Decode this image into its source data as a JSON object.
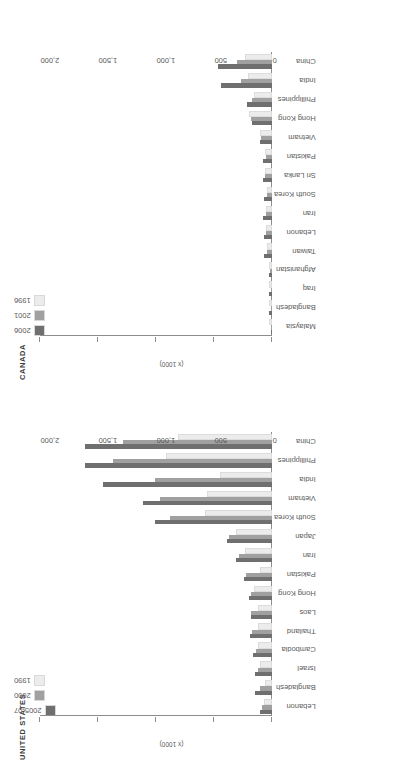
{
  "colors": {
    "series_dark": "#6f6f6f",
    "series_mid": "#a0a0a0",
    "series_light": "#ececec",
    "axis": "#8d8d8d",
    "text": "#545454"
  },
  "axis": {
    "unit_label": "(x 1000)",
    "ticks": [
      "0",
      "500",
      "1,000",
      "1,500",
      "2,000"
    ],
    "min": 0,
    "max": 2000
  },
  "charts": [
    {
      "title": "CANADA",
      "legend": [
        {
          "label": "2006",
          "color": "#6f6f6f"
        },
        {
          "label": "2001",
          "color": "#a0a0a0"
        },
        {
          "label": "1996",
          "color": "#ececec"
        }
      ],
      "categories": [
        "Malaysia",
        "Bangladesh",
        "Iraq",
        "Afghanistan",
        "Taiwan",
        "Lebanon",
        "Iran",
        "South Korea",
        "Sri Lanka",
        "Pakistan",
        "Vietnam",
        "Hong Kong",
        "Phillippines",
        "India",
        "China"
      ],
      "series": [
        {
          "name": "2006",
          "values": [
            8,
            22,
            23,
            28,
            65,
            65,
            75,
            65,
            80,
            75,
            105,
            175,
            215,
            440,
            465
          ]
        },
        {
          "name": "2001",
          "values": [
            6,
            10,
            12,
            14,
            45,
            48,
            50,
            45,
            60,
            55,
            95,
            180,
            175,
            270,
            300
          ]
        },
        {
          "name": "1996",
          "values": [
            4,
            6,
            8,
            9,
            30,
            35,
            35,
            30,
            45,
            40,
            85,
            180,
            135,
            190,
            215
          ]
        }
      ]
    },
    {
      "title": "UNITED STATES",
      "legend": [
        {
          "label": "2005-07",
          "color": "#6f6f6f"
        },
        {
          "label": "2000",
          "color": "#a0a0a0"
        },
        {
          "label": "1990",
          "color": "#ececec"
        }
      ],
      "categories": [
        "Lebanon",
        "Bangladesh",
        "Israel",
        "Cambodia",
        "Thailand",
        "Laos",
        "Hong Kong",
        "Pakistan",
        "Iran",
        "Japan",
        "South Korea",
        "Vietnam",
        "India",
        "Phillippines",
        "China"
      ],
      "series": [
        {
          "name": "2005-07",
          "values": [
            105,
            150,
            145,
            165,
            190,
            185,
            200,
            245,
            310,
            390,
            1010,
            1110,
            1460,
            1610,
            1610
          ]
        },
        {
          "name": "2000",
          "values": [
            90,
            105,
            125,
            140,
            170,
            180,
            180,
            225,
            285,
            375,
            880,
            965,
            1010,
            1370,
            1285
          ]
        },
        {
          "name": "1990",
          "values": [
            55,
            45,
            90,
            105,
            105,
            105,
            140,
            90,
            215,
            290,
            560,
            545,
            430,
            900,
            790
          ]
        }
      ]
    }
  ],
  "chart_data": {
    "type": "bar",
    "xlabel": "",
    "ylabel": "(x 1000)",
    "ylim": [
      0,
      2000
    ],
    "grid": false,
    "orientation": "vertical-bars-in-rotated-page",
    "legend_position": "top-left",
    "panels": [
      {
        "panel_title": "CANADA",
        "categories": [
          "Malaysia",
          "Bangladesh",
          "Iraq",
          "Afghanistan",
          "Taiwan",
          "Lebanon",
          "Iran",
          "South Korea",
          "Sri Lanka",
          "Pakistan",
          "Vietnam",
          "Hong Kong",
          "Phillippines",
          "India",
          "China"
        ],
        "series": [
          {
            "name": "2006",
            "values": [
              8,
              22,
              23,
              28,
              65,
              65,
              75,
              65,
              80,
              75,
              105,
              175,
              215,
              440,
              465
            ]
          },
          {
            "name": "2001",
            "values": [
              6,
              10,
              12,
              14,
              45,
              48,
              50,
              45,
              60,
              55,
              95,
              180,
              175,
              270,
              300
            ]
          },
          {
            "name": "1996",
            "values": [
              4,
              6,
              8,
              9,
              30,
              35,
              35,
              30,
              45,
              40,
              85,
              180,
              135,
              190,
              215
            ]
          }
        ]
      },
      {
        "panel_title": "UNITED STATES",
        "categories": [
          "Lebanon",
          "Bangladesh",
          "Israel",
          "Cambodia",
          "Thailand",
          "Laos",
          "Hong Kong",
          "Pakistan",
          "Iran",
          "Japan",
          "South Korea",
          "Vietnam",
          "India",
          "Phillippines",
          "China"
        ],
        "series": [
          {
            "name": "2005-07",
            "values": [
              105,
              150,
              145,
              165,
              190,
              185,
              200,
              245,
              310,
              390,
              1010,
              1110,
              1460,
              1610,
              1610
            ]
          },
          {
            "name": "2000",
            "values": [
              90,
              105,
              125,
              140,
              170,
              180,
              180,
              225,
              285,
              375,
              880,
              965,
              1010,
              1370,
              1285
            ]
          },
          {
            "name": "1990",
            "values": [
              55,
              45,
              90,
              105,
              105,
              105,
              140,
              90,
              215,
              290,
              560,
              545,
              430,
              900,
              790
            ]
          }
        ]
      }
    ]
  }
}
